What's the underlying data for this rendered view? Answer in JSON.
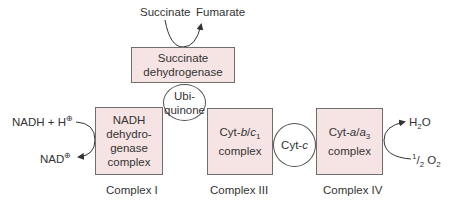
{
  "colors": {
    "box_fill": "#f6e4e4",
    "box_border": "#6e6e6e",
    "arrow": "#333333"
  },
  "succinate_reaction": {
    "substrate": "Succinate",
    "product": "Fumarate"
  },
  "succinate_dehydrogenase": {
    "line1": "Succinate",
    "line2": "dehydrogenase"
  },
  "ubiquinone": {
    "line1": "Ubi-",
    "line2": "quinone"
  },
  "complex_1": {
    "line1": "NADH",
    "line2": "dehydro-",
    "line3": "genase",
    "line4": "complex",
    "caption": "Complex I"
  },
  "complex_1_reaction": {
    "substrate": "NADH + H",
    "substrate_charge": "⊕",
    "product": "NAD",
    "product_charge": "⊕"
  },
  "complex_3": {
    "name_prefix": "Cyt-",
    "name_b": "b",
    "slash": "/",
    "name_c": "c",
    "sub": "1",
    "line2": "complex",
    "caption": "Complex III"
  },
  "cyt_c": {
    "prefix": "Cyt-",
    "italic": "c"
  },
  "complex_4": {
    "name_prefix": "Cyt-",
    "name_a": "a",
    "slash": "/",
    "name_a3": "a",
    "sub": "3",
    "line2": "complex",
    "caption": "Complex IV"
  },
  "complex_4_reaction": {
    "product_h": "H",
    "product_sub": "2",
    "product_o": "O",
    "substrate_num": "1",
    "substrate_den": "2",
    "substrate_o": "O",
    "substrate_sub": "2"
  }
}
